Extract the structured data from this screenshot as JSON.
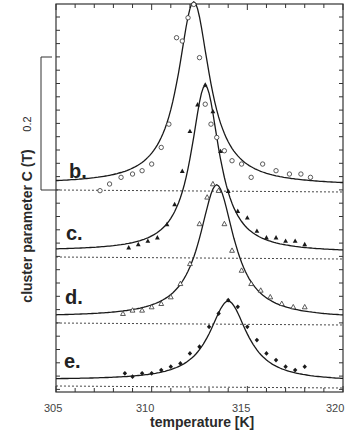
{
  "chart_data": {
    "type": "scatter",
    "title": "",
    "xlabel": "temperature [K]",
    "ylabel": "cluster parameter  C (T)",
    "xlim": [
      305,
      320
    ],
    "xticks": [
      305,
      310,
      315,
      320
    ],
    "scale_bar": {
      "label": "0.2",
      "value": 0.2
    },
    "grid": false,
    "legend": "none (curves labelled b.–e.)",
    "note": "Curves are vertically offset; each has its own dashed baseline. Values are C(T) above baseline, estimated from the 0.2 scale bar.",
    "series": [
      {
        "name": "b.",
        "marker": "open circle",
        "peak_T": 312.2,
        "peak_C": 0.275,
        "x": [
          307.3,
          307.8,
          308.4,
          309.0,
          309.5,
          310.0,
          310.5,
          310.9,
          311.3,
          311.6,
          311.9,
          312.2,
          312.5,
          312.8,
          313.1,
          313.4,
          313.8,
          314.2,
          314.7,
          315.2,
          315.8,
          316.5,
          317.2,
          317.8,
          318.3
        ],
        "y": [
          -0.01,
          0.0,
          0.01,
          0.015,
          0.02,
          0.03,
          0.055,
          0.09,
          0.22,
          0.215,
          0.25,
          0.27,
          0.19,
          0.12,
          0.09,
          0.07,
          0.05,
          0.035,
          0.03,
          0.01,
          0.03,
          0.02,
          0.015,
          0.015,
          0.01
        ]
      },
      {
        "name": "c.",
        "marker": "filled triangle",
        "peak_T": 312.8,
        "peak_C": 0.25,
        "x": [
          308.8,
          309.3,
          309.8,
          310.3,
          310.8,
          311.2,
          311.6,
          312.0,
          312.4,
          312.8,
          313.2,
          313.6,
          314.0,
          314.5,
          315.0,
          315.5,
          316.0,
          316.5,
          317.0,
          317.5,
          318.0
        ],
        "y": [
          0.005,
          0.01,
          0.015,
          0.02,
          0.04,
          0.07,
          0.12,
          0.18,
          0.22,
          0.25,
          0.21,
          0.15,
          0.09,
          0.06,
          0.05,
          0.03,
          0.02,
          0.02,
          0.015,
          0.015,
          0.01
        ]
      },
      {
        "name": "d.",
        "marker": "open triangle",
        "peak_T": 313.4,
        "peak_C": 0.2,
        "x": [
          308.5,
          309.0,
          309.5,
          310.0,
          310.5,
          311.0,
          311.5,
          312.0,
          312.5,
          312.9,
          313.2,
          313.5,
          313.8,
          314.2,
          314.7,
          315.2,
          315.7,
          316.2,
          316.8,
          317.4,
          318.0
        ],
        "y": [
          0.005,
          0.01,
          0.01,
          0.015,
          0.02,
          0.03,
          0.05,
          0.08,
          0.14,
          0.18,
          0.2,
          0.19,
          0.14,
          0.1,
          0.07,
          0.05,
          0.04,
          0.03,
          0.02,
          0.015,
          0.015
        ]
      },
      {
        "name": "e.",
        "marker": "filled diamond",
        "peak_T": 314.0,
        "peak_C": 0.12,
        "x": [
          308.6,
          309.0,
          309.5,
          310.0,
          310.5,
          311.0,
          311.5,
          312.0,
          312.5,
          313.0,
          313.5,
          314.0,
          314.5,
          315.0,
          315.5,
          316.0,
          316.5,
          317.0,
          317.5,
          318.0
        ],
        "y": [
          0.01,
          0.005,
          0.01,
          0.01,
          0.015,
          0.02,
          0.025,
          0.04,
          0.05,
          0.08,
          0.1,
          0.12,
          0.11,
          0.08,
          0.06,
          0.04,
          0.03,
          0.02,
          0.015,
          0.02
        ]
      }
    ]
  },
  "labels": {
    "ylabel": "cluster parameter   C (T)",
    "xlabel": "temperature [K]",
    "scale": "0.2",
    "x305": "305",
    "x310": "310",
    "x315": "315",
    "x320": "320",
    "b": "b.",
    "c": "c.",
    "d": "d.",
    "e": "e."
  }
}
